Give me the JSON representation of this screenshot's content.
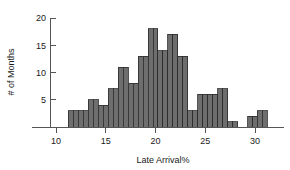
{
  "chart_data": {
    "type": "bar",
    "title": "",
    "subtitle": "",
    "xlabel": "Late Arrival%",
    "ylabel": "# of Months",
    "grid": false,
    "legend": null,
    "legend_position": "none",
    "bin_width": 0.5,
    "xlim": [
      9.0,
      32.5
    ],
    "ylim": [
      0,
      21
    ],
    "x_ticks": [
      10,
      15,
      20,
      25,
      30
    ],
    "x_tick_labels": [
      "10",
      "15",
      "20",
      "25",
      "30"
    ],
    "y_ticks": [
      5,
      10,
      15,
      20
    ],
    "y_tick_labels": [
      "5",
      "10",
      "15",
      "20"
    ],
    "bar_fill": "#6e6e6e",
    "bar_edge": "#2b2b2b",
    "axis_color": "#555555",
    "bin_starts": [
      11.25,
      11.75,
      12.25,
      12.75,
      13.25,
      13.75,
      14.25,
      14.75,
      15.25,
      15.75,
      16.25,
      16.75,
      17.25,
      17.75,
      18.25,
      18.75,
      19.25,
      19.75,
      20.25,
      20.75,
      21.25,
      21.75,
      22.25,
      22.75,
      23.25,
      23.75,
      24.25,
      24.75,
      25.25,
      25.75,
      26.25,
      26.75,
      27.25,
      27.75,
      28.25,
      28.75,
      29.25,
      29.75,
      30.25,
      30.75
    ],
    "categories": [
      "11.25-11.75",
      "11.75-12.25",
      "12.25-12.75",
      "12.75-13.25",
      "13.25-13.75",
      "13.75-14.25",
      "14.25-14.75",
      "14.75-15.25",
      "15.25-15.75",
      "15.75-16.25",
      "16.25-16.75",
      "16.75-17.25",
      "17.25-17.75",
      "17.75-18.25",
      "18.25-18.75",
      "18.75-19.25",
      "19.25-19.75",
      "19.75-20.25",
      "20.25-20.75",
      "20.75-21.25",
      "21.25-21.75",
      "21.75-22.25",
      "22.25-22.75",
      "22.75-23.25",
      "23.25-23.75",
      "23.75-24.25",
      "24.25-24.75",
      "24.75-25.25",
      "25.25-25.75",
      "25.75-26.25",
      "26.25-26.75",
      "26.75-27.25",
      "27.25-27.75",
      "27.75-28.25",
      "28.25-28.75",
      "28.75-29.25",
      "29.25-29.75",
      "29.75-30.25",
      "30.25-30.75",
      "30.75-31.25"
    ],
    "values": [
      3,
      3,
      3,
      3,
      5,
      5,
      4,
      4,
      7,
      7,
      11,
      11,
      8,
      8,
      13,
      13,
      18,
      18,
      14,
      14,
      17,
      17,
      13,
      13,
      3,
      3,
      6,
      6,
      6,
      6,
      7,
      7,
      1,
      1,
      0,
      0,
      2,
      2,
      3,
      3
    ]
  }
}
